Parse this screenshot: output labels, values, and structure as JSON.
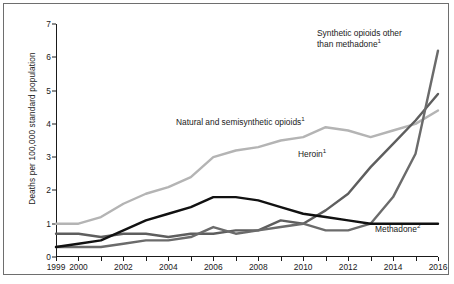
{
  "chart_data": {
    "type": "line",
    "title": "",
    "xlabel": "",
    "ylabel": "Deaths per 100,000 standard population",
    "xlim": [
      1999,
      2016
    ],
    "ylim": [
      0,
      7
    ],
    "yticks": [
      0,
      1,
      2,
      3,
      4,
      5,
      6,
      7
    ],
    "xticks": [
      1999,
      2000,
      2001,
      2002,
      2003,
      2004,
      2005,
      2006,
      2007,
      2008,
      2009,
      2010,
      2011,
      2012,
      2013,
      2014,
      2015,
      2016
    ],
    "xtick_labels": [
      "1999",
      "2000",
      "",
      "2002",
      "",
      "2004",
      "",
      "2006",
      "",
      "2008",
      "",
      "2010",
      "",
      "2012",
      "",
      "2014",
      "",
      "2016"
    ],
    "grid": false,
    "legend": "inline-annotations",
    "x": [
      1999,
      2000,
      2001,
      2002,
      2003,
      2004,
      2005,
      2006,
      2007,
      2008,
      2009,
      2010,
      2011,
      2012,
      2013,
      2014,
      2015,
      2016
    ],
    "series": [
      {
        "name": "Natural and semisynthetic opioids",
        "color": "#b4b4b4",
        "values": [
          1.0,
          1.0,
          1.2,
          1.6,
          1.9,
          2.1,
          2.4,
          3.0,
          3.2,
          3.3,
          3.5,
          3.6,
          3.9,
          3.8,
          3.6,
          3.8,
          4.0,
          4.4
        ]
      },
      {
        "name": "Heroin",
        "color": "#5e5e5e",
        "values": [
          0.7,
          0.7,
          0.6,
          0.7,
          0.7,
          0.6,
          0.7,
          0.7,
          0.8,
          0.8,
          1.1,
          1.0,
          1.4,
          1.9,
          2.7,
          3.4,
          4.1,
          4.9
        ]
      },
      {
        "name": "Synthetic opioids other than methadone",
        "color": "#6b6b6b",
        "values": [
          0.3,
          0.3,
          0.3,
          0.4,
          0.5,
          0.5,
          0.6,
          0.9,
          0.7,
          0.8,
          0.9,
          1.0,
          0.8,
          0.8,
          1.0,
          1.8,
          3.1,
          6.2
        ]
      },
      {
        "name": "Methadone",
        "color": "#111111",
        "values": [
          0.3,
          0.4,
          0.5,
          0.8,
          1.1,
          1.3,
          1.5,
          1.8,
          1.8,
          1.7,
          1.5,
          1.3,
          1.2,
          1.1,
          1.0,
          1.0,
          1.0,
          1.0
        ]
      }
    ],
    "annotations": [
      {
        "id": "synthetic",
        "text_line1": "Synthetic opioids other",
        "text_line2": "than methadone",
        "footnote": "1"
      },
      {
        "id": "natural",
        "text_line1": "Natural and semisynthetic opioids",
        "text_line2": "",
        "footnote": "1"
      },
      {
        "id": "heroin",
        "text_line1": "Heroin",
        "text_line2": "",
        "footnote": "1"
      },
      {
        "id": "methadone",
        "text_line1": "Methadone",
        "text_line2": "",
        "footnote": "2"
      }
    ]
  }
}
